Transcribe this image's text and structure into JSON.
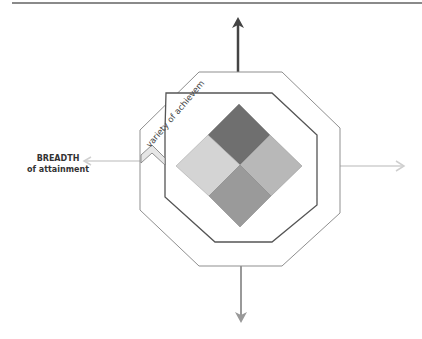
{
  "diagram": {
    "labels": {
      "breadth_title": "BREADTH",
      "breadth_sub": "of attainment",
      "ring_text": "variety of achievement"
    },
    "colors": {
      "arrow_up": "#444444",
      "arrow_down": "#999999",
      "arrow_side": "#cccccc",
      "top_tile": "#6f6f6f",
      "left_tile": "#d4d4d4",
      "right_tile": "#b8b8b8",
      "bottom_tile": "#9a9a9a",
      "outer_octagon": "#8f8f8f",
      "inner_octagon": "#555555"
    }
  }
}
